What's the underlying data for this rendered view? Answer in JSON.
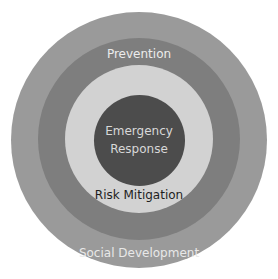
{
  "diagram": {
    "type": "concentric-circles",
    "rings": [
      {
        "name": "Social Development",
        "label": "Social Development",
        "color": "#9a9a9a",
        "text_color": "#e8e8e8"
      },
      {
        "name": "Prevention",
        "label": "Prevention",
        "color": "#7e7e7e",
        "text_color": "#ececec"
      },
      {
        "name": "Risk Mitigation",
        "label": "Risk Mitigation",
        "color": "#d2d2d2",
        "text_color": "#1e1e1e"
      },
      {
        "name": "Emergency Response",
        "label_line1": "Emergency",
        "label_line2": "Response",
        "color": "#4c4c4c",
        "text_color": "#d8d8d8"
      }
    ]
  }
}
